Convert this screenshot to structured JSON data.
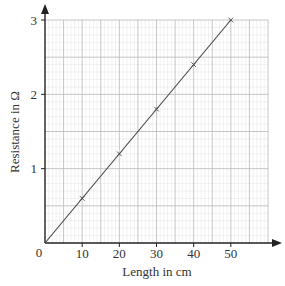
{
  "chart_data": {
    "type": "line",
    "title": "",
    "xlabel": "Length in cm",
    "ylabel": "Resistance in Ω",
    "xlim": [
      0,
      60
    ],
    "ylim": [
      0,
      3
    ],
    "x_ticks": [
      10,
      20,
      30,
      40,
      50
    ],
    "y_ticks": [
      1,
      2,
      3
    ],
    "origin_label": "0",
    "grid": true,
    "grid_minor_x": 1,
    "grid_minor_y": 0.1,
    "grid_major_x": 5,
    "grid_major_y": 0.5,
    "series": [
      {
        "name": "Resistance vs length",
        "marker": "x",
        "x": [
          10,
          20,
          30,
          40,
          50
        ],
        "y": [
          0.6,
          1.2,
          1.8,
          2.4,
          3.0
        ]
      }
    ],
    "best_fit_line": {
      "from": [
        0,
        0
      ],
      "to": [
        50,
        3.0
      ]
    },
    "legend": null
  },
  "colors": {
    "axis": "#222222",
    "line": "#444444",
    "grid_minor": "#e4e4e4",
    "grid_major": "#b8b8b8",
    "text": "#333333"
  }
}
